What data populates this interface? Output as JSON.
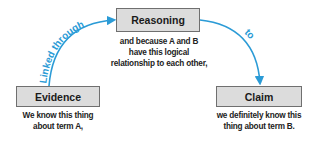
{
  "diagram": {
    "nodes": [
      {
        "id": "reasoning",
        "label": "Reasoning",
        "description_lines": [
          "and because A and B",
          "have this logical",
          "relationship to each other,"
        ]
      },
      {
        "id": "evidence",
        "label": "Evidence",
        "description_lines": [
          "We know this thing",
          "about term A,"
        ]
      },
      {
        "id": "claim",
        "label": "Claim",
        "description_lines": [
          "we definitely know this",
          "thing about term B."
        ]
      }
    ],
    "edges": [
      {
        "from": "evidence",
        "to": "reasoning",
        "label": "Linked through"
      },
      {
        "from": "reasoning",
        "to": "claim",
        "label": "to"
      }
    ],
    "colors": {
      "arrow": "#2b9bd6",
      "box_fill": "#dcdcdc",
      "box_border": "#6f6f6f",
      "text": "#1a1a1a"
    }
  }
}
